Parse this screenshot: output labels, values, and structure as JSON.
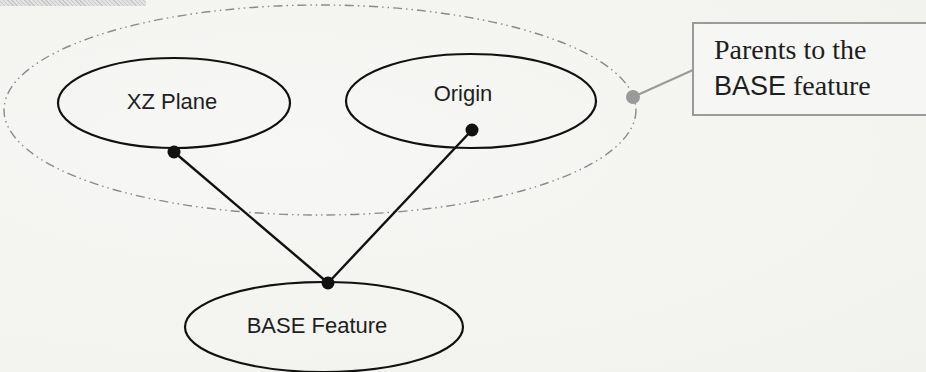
{
  "diagram": {
    "type": "parent-child dependency diagram",
    "nodes": [
      {
        "id": "xz_plane",
        "label": "XZ Plane",
        "role": "parent",
        "cx": 174,
        "cy": 103,
        "rx": 116,
        "ry": 45
      },
      {
        "id": "origin",
        "label": "Origin",
        "role": "parent",
        "cx": 471,
        "cy": 101,
        "rx": 125,
        "ry": 47
      },
      {
        "id": "base_feature",
        "label": "BASE Feature",
        "role": "child",
        "cx": 324,
        "cy": 327,
        "rx": 139,
        "ry": 45
      }
    ],
    "edges": [
      {
        "from": "xz_plane",
        "to": "base_feature"
      },
      {
        "from": "origin",
        "to": "base_feature"
      }
    ],
    "group": {
      "label": "parents-group",
      "members": [
        "xz_plane",
        "origin"
      ],
      "style": "dash-dot",
      "color": "#8a8a8a"
    },
    "callout": {
      "line1": "Parents to the",
      "line2_sans": "BASE",
      "line2_serif": " feature",
      "border_color": "#9a9a9a"
    },
    "colors": {
      "stroke": "#111111",
      "connector_dot": "#111111",
      "group_dot": "#999999",
      "background": "#f5f5f3"
    }
  }
}
